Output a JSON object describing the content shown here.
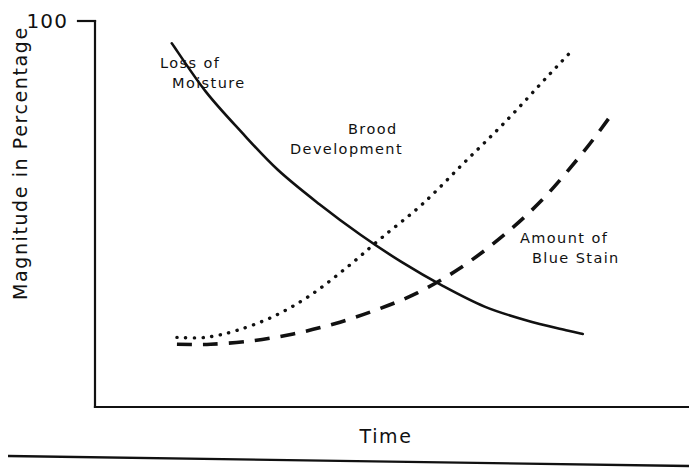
{
  "chart_data": {
    "type": "line",
    "title": "",
    "xlabel": "Time",
    "ylabel": "Magnitude in Percentage",
    "ylim": [
      0,
      100
    ],
    "xlim": [
      0,
      100
    ],
    "grid": false,
    "legend_position": "inline-annotations",
    "y_tick_labels": [
      "100"
    ],
    "y_ticks": [
      100
    ],
    "x_tick_labels": [],
    "x_ticks": [],
    "series": [
      {
        "name": "Loss of Moisture",
        "style": "solid",
        "label_lines": [
          "Loss of",
          "Moisture"
        ],
        "label_x": 160,
        "label_y": 68,
        "x": [
          7.5,
          14,
          21,
          28,
          36,
          44,
          52,
          60,
          68,
          76,
          84,
          87
        ],
        "values": [
          97,
          83,
          71,
          60,
          50,
          41,
          33,
          26,
          20,
          16,
          13,
          12
        ]
      },
      {
        "name": "Brood Development",
        "style": "dotted",
        "label_lines": [
          "Brood",
          "Development"
        ],
        "label_x": 348,
        "label_y": 134,
        "x": [
          8.5,
          14,
          20,
          27,
          34,
          41,
          48,
          56,
          64,
          72,
          80,
          85
        ],
        "values": [
          11,
          11,
          13,
          17,
          23,
          31,
          40,
          50,
          62,
          74,
          87,
          95
        ]
      },
      {
        "name": "Amount of Blue Stain",
        "style": "dashed",
        "label_lines": [
          "Amount of",
          "Blue Stain"
        ],
        "label_x": 520,
        "label_y": 243,
        "x": [
          8.5,
          15,
          23,
          31,
          39,
          47,
          55,
          63,
          71,
          79,
          87,
          93
        ],
        "values": [
          9,
          9,
          10,
          12,
          15,
          19,
          24,
          31,
          40,
          51,
          65,
          77
        ]
      }
    ]
  },
  "annotations": {
    "y_axis_top_label": "100",
    "x_axis_label": "Time",
    "y_axis_label": "Magnitude in Percentage"
  },
  "colors": {
    "ink": "#111111",
    "background": "#ffffff"
  }
}
